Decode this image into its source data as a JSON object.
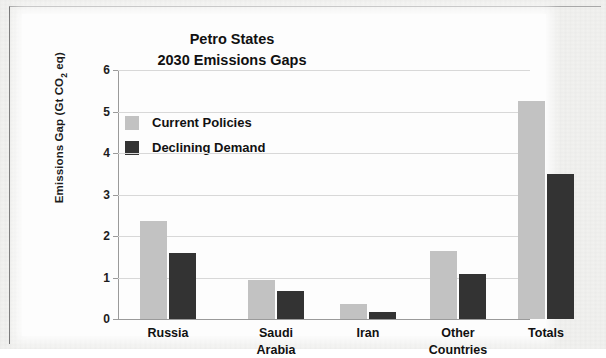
{
  "chart_data": {
    "type": "bar",
    "title": "Petro States\n2030 Emissions Gaps",
    "title_line1": "Petro States",
    "title_line2": "2030 Emissions Gaps",
    "xlabel": "",
    "ylabel": "Emissions Gap (Gt CO2 eq)",
    "ylabel_prefix": "Emissions Gap (Gt CO",
    "ylabel_sub": "2",
    "ylabel_suffix": " eq)",
    "ylim": [
      0,
      6
    ],
    "yticks": [
      "0",
      "1",
      "2",
      "3",
      "4",
      "5",
      "6"
    ],
    "ytick_values": [
      0,
      1,
      2,
      3,
      4,
      5,
      6
    ],
    "grid": true,
    "legend_position": "upper-center-inside",
    "categories": [
      "Russia",
      "Saudi\nArabia",
      "Iran",
      "Other\nCountries",
      "Totals"
    ],
    "series": [
      {
        "name": "Current Policies",
        "color": "#c2c2c2",
        "values": [
          2.35,
          0.93,
          0.36,
          1.63,
          5.25
        ]
      },
      {
        "name": "Declining Demand",
        "color": "#333333",
        "values": [
          1.6,
          0.68,
          0.18,
          1.09,
          3.49
        ]
      }
    ]
  },
  "style": {
    "page_background": "#f2f2f0",
    "canvas_background": "#fdfdfd",
    "axis_color": "#9a9a9a",
    "grid_color": "#d8d8d8",
    "text_color": "#111111"
  }
}
